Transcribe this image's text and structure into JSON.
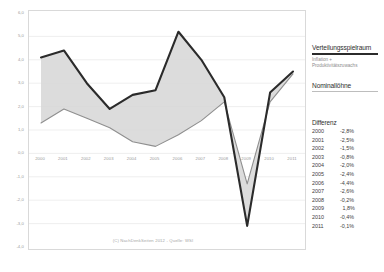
{
  "legend": {
    "title": "Verteilungsspielraum",
    "subtitle_line1": "Inflation +",
    "subtitle_line2": "Produktivitätszuwachs",
    "series2_title": "Nominallöhne"
  },
  "difference_table": {
    "title": "Differenz",
    "rows": [
      {
        "year": "2000",
        "value": "-2,8%"
      },
      {
        "year": "2001",
        "value": "-2,5%"
      },
      {
        "year": "2002",
        "value": "-1,5%"
      },
      {
        "year": "2003",
        "value": "-0,8%"
      },
      {
        "year": "2004",
        "value": "-2,0%"
      },
      {
        "year": "2005",
        "value": "-2,4%"
      },
      {
        "year": "2006",
        "value": "-4,4%"
      },
      {
        "year": "2007",
        "value": "-2,6%"
      },
      {
        "year": "2008",
        "value": "-0,2%"
      },
      {
        "year": "2009",
        "value": "1,8%"
      },
      {
        "year": "2010",
        "value": "-0,4%"
      },
      {
        "year": "2011",
        "value": "-0,1%"
      }
    ]
  },
  "credit": "(C) NachDenkSeiten 2012 - Quelle: WSI",
  "colors": {
    "series_verteilungsspielraum": "#2b2b2b",
    "series_nominalloehne": "#8f8f8f",
    "band_fill": "#d6d6d6",
    "gridline": "#e8e8e8",
    "frame": "#d9d9d9",
    "tick_text": "#9a9a9a"
  },
  "chart_data": {
    "type": "line",
    "title": "",
    "xlabel": "",
    "ylabel": "",
    "ylim": [
      -4.0,
      6.0
    ],
    "yticks": [
      "6,0",
      "5,0",
      "4,0",
      "3,0",
      "2,0",
      "1,0",
      "0,0",
      "-1,0",
      "-2,0",
      "-3,0",
      "-4,0"
    ],
    "ytick_values": [
      6.0,
      5.0,
      4.0,
      3.0,
      2.0,
      1.0,
      0.0,
      -1.0,
      -2.0,
      -3.0,
      -4.0
    ],
    "grid": true,
    "legend_position": "right",
    "categories": [
      "2000",
      "2001",
      "2002",
      "2003",
      "2004",
      "2005",
      "2006",
      "2007",
      "2008",
      "2009",
      "2010",
      "2011"
    ],
    "series": [
      {
        "name": "Verteilungsspielraum",
        "color": "#2b2b2b",
        "values": [
          4.1,
          4.4,
          3.0,
          1.9,
          2.5,
          2.7,
          5.2,
          4.0,
          2.4,
          -3.1,
          2.6,
          3.5
        ]
      },
      {
        "name": "Nominallöhne",
        "color": "#8f8f8f",
        "values": [
          1.3,
          1.9,
          1.5,
          1.1,
          0.5,
          0.3,
          0.8,
          1.4,
          2.2,
          -1.3,
          2.2,
          3.4
        ]
      }
    ],
    "annotation_series": {
      "name": "Differenz",
      "values": [
        -2.8,
        -2.5,
        -1.5,
        -0.8,
        -2.0,
        -2.4,
        -4.4,
        -2.6,
        -0.2,
        1.8,
        -0.4,
        -0.1
      ]
    }
  }
}
